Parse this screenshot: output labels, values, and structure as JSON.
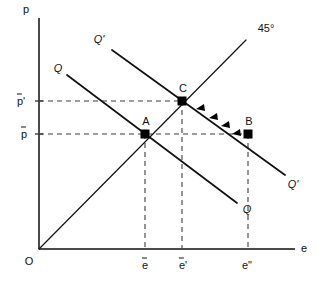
{
  "figure": {
    "type": "economics-diagram",
    "title_visible": false,
    "background": "#ffffff",
    "ink_color": "#111111",
    "axis_color": "#4a4a4a",
    "width": 318,
    "height": 282
  },
  "axes": {
    "y_label": "p",
    "x_label": "e",
    "origin_label": "O",
    "y_axis": {
      "x": 39,
      "top": 18,
      "bottom": 249
    },
    "x_axis": {
      "y": 249,
      "left": 39,
      "right": 295
    }
  },
  "y_ticks": [
    {
      "id": "p-bar-prime",
      "base": "p",
      "prime": "'",
      "overbar": true,
      "value_y": 101,
      "label_x": 20,
      "label_y": 101
    },
    {
      "id": "p-bar",
      "base": "p",
      "prime": "",
      "overbar": true,
      "value_y": 134,
      "label_x": 23,
      "label_y": 134
    }
  ],
  "x_ticks": [
    {
      "id": "e-bar",
      "base": "e",
      "prime": "",
      "overbar": true,
      "value_x": 145,
      "label_x": 145,
      "label_y": 264
    },
    {
      "id": "e-bar-prime",
      "base": "e",
      "prime": "'",
      "overbar": true,
      "value_x": 182,
      "label_x": 182,
      "label_y": 264
    },
    {
      "id": "e-double-prime",
      "base": "e",
      "prime": "\"",
      "overbar": false,
      "value_x": 247,
      "label_x": 247,
      "label_y": 264
    }
  ],
  "curves": [
    {
      "id": "demand-Q",
      "name": "Q",
      "path": "M 67 75 L 237 203",
      "start_label": {
        "text": "Q",
        "x": 58,
        "y": 68
      },
      "end_label": {
        "text": "Q",
        "x": 247,
        "y": 209
      }
    },
    {
      "id": "demand-Q-prime",
      "name": "Q'",
      "path": "M 112 50 L 285 175",
      "start_label": {
        "text": "Q'",
        "x": 99,
        "y": 39
      },
      "end_label": {
        "text": "Q'",
        "x": 293,
        "y": 184
      }
    }
  ],
  "ray": {
    "id": "forty-five-degree-line",
    "label": "45°",
    "path": "M 39 249 L 246 40",
    "label_x": 266,
    "label_y": 28
  },
  "points": [
    {
      "id": "point-A",
      "label": "A",
      "x": 145,
      "y": 134,
      "label_x": 146,
      "label_y": 121
    },
    {
      "id": "point-C",
      "label": "C",
      "x": 182,
      "y": 101,
      "label_x": 183,
      "label_y": 88
    },
    {
      "id": "point-B",
      "label": "B",
      "x": 248,
      "y": 134,
      "label_x": 249,
      "label_y": 121
    }
  ],
  "guides": [
    {
      "id": "guide-h-p-bar-prime",
      "orientation": "horizontal",
      "path": "M 39 101 L 182 101"
    },
    {
      "id": "guide-h-p-bar",
      "orientation": "horizontal",
      "path": "M 39 134 L 248 134"
    },
    {
      "id": "guide-v-e-bar",
      "orientation": "vertical",
      "path": "M 145 134 L 145 249"
    },
    {
      "id": "guide-v-e-bar-prime",
      "orientation": "vertical",
      "path": "M 182 101 L 182 249"
    },
    {
      "id": "guide-v-e-double-prime",
      "orientation": "vertical",
      "path": "M 248 134 L 248 249"
    }
  ],
  "adjustment_arrows": {
    "id": "adjustment-path-B-to-C",
    "direction": "from B toward C",
    "count": 4,
    "markers": [
      {
        "x": 196,
        "y": 109
      },
      {
        "x": 209,
        "y": 118
      },
      {
        "x": 221,
        "y": 126
      },
      {
        "x": 232,
        "y": 134
      }
    ]
  }
}
